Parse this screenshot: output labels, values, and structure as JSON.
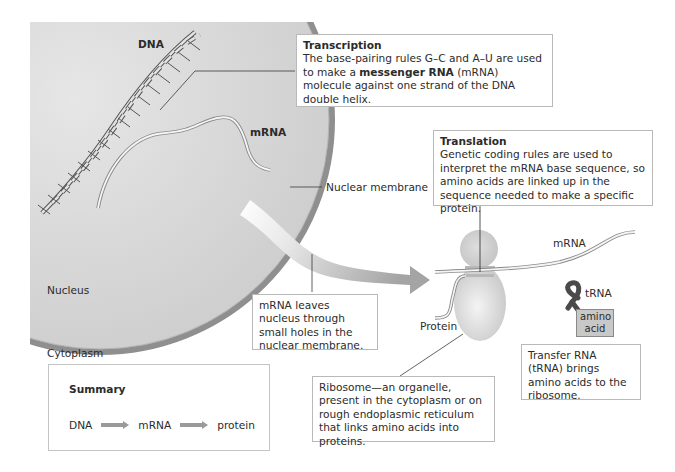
{
  "labels": {
    "dna": "DNA",
    "mrna_nucleus": "mRNA",
    "nuclear_membrane": "Nuclear membrane",
    "nucleus": "Nucleus",
    "cytoplasm": "Cytoplasm",
    "mrna_cytoplasm": "mRNA",
    "trna": "tRNA",
    "amino_acid_line1": "amino",
    "amino_acid_line2": "acid",
    "protein": "Protein"
  },
  "transcription": {
    "title": "Transcription",
    "text_before": "The base-pairing rules G–C and A–U are used to make a ",
    "bold": "messenger RNA",
    "text_after": " (mRNA) molecule against one strand of the DNA double helix."
  },
  "translation": {
    "title": "Translation",
    "text": "Genetic coding rules are used to interpret the mRNA base sequence, so amino acids are linked up in the sequence needed to make a specific protein."
  },
  "mrna_leaves": {
    "text": "mRNA leaves nucleus through small holes in the nuclear membrane."
  },
  "ribosome": {
    "text": "Ribosome—an organelle, present in the cytoplasm or on rough endoplasmic reticulum that links amino acids into proteins."
  },
  "trna_box": {
    "text": "Transfer RNA (tRNA) brings amino acids to the ribosome."
  },
  "summary": {
    "title": "Summary",
    "flow": [
      "DNA",
      "mRNA",
      "protein"
    ]
  },
  "colors": {
    "nucleus_fill": "#d6d6d6",
    "membrane": "#8f8f8f",
    "arrow": "#a8a8a8",
    "ribosome": "#cfcfcf",
    "trna": "#4a4a4a",
    "amino_acid_fill": "#c8c8c8"
  }
}
